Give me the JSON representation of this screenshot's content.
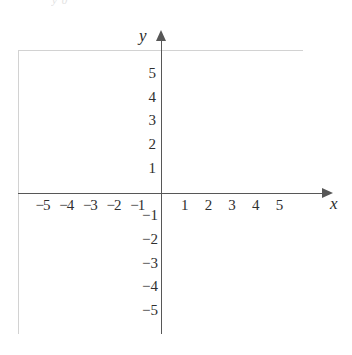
{
  "figure": {
    "type": "coordinate-grid",
    "top_fragment": "y 0 ",
    "axes": {
      "x_label": "x",
      "y_label": "y",
      "x_arrow": "arrow-right",
      "y_arrow": "arrow-up",
      "axis_color": "#575757",
      "grid_color": "#d4d4d4"
    },
    "x_ticks_negative": [
      "−5",
      "−4",
      "−3",
      "−2",
      "−1"
    ],
    "x_ticks_positive": [
      "1",
      "2",
      "3",
      "4",
      "5"
    ],
    "y_ticks_positive": [
      "5",
      "4",
      "3",
      "2",
      "1"
    ],
    "y_ticks_negative": [
      "−1",
      "−2",
      "−3",
      "−4",
      "−5"
    ]
  },
  "chart_data": {
    "type": "scatter",
    "title": "",
    "subtitle": "",
    "xlabel": "x",
    "ylabel": "y",
    "xlim": [
      -6,
      6
    ],
    "ylim": [
      -6,
      6
    ],
    "xticks": [
      -5,
      -4,
      -3,
      -2,
      -1,
      1,
      2,
      3,
      4,
      5
    ],
    "yticks": [
      -5,
      -4,
      -3,
      -2,
      -1,
      1,
      2,
      3,
      4,
      5
    ],
    "xticklabels": [
      "−5",
      "−4",
      "−3",
      "−2",
      "−1",
      "1",
      "2",
      "3",
      "4",
      "5"
    ],
    "yticklabels": [
      "−5",
      "−4",
      "−3",
      "−2",
      "−1",
      "1",
      "2",
      "3",
      "4",
      "5"
    ],
    "grid": true,
    "grid_style": "dotted",
    "legend": null,
    "legend_position": null,
    "annotations": [],
    "series": [
      {
        "name": "",
        "x": [],
        "y": []
      }
    ]
  }
}
